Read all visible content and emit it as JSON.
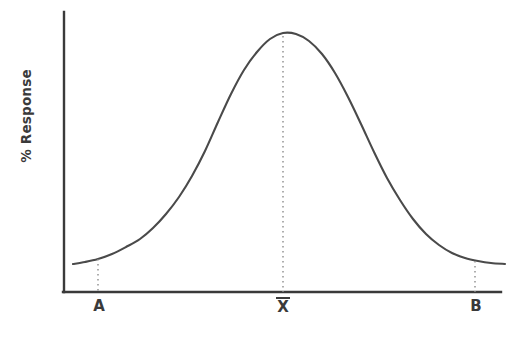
{
  "figure": {
    "kind": "normal-distribution-curve",
    "background": "#ffffff",
    "curve_color": "#4a4a4a",
    "axis_color": "#3a3a3a",
    "guide_color": "#8c8c8c",
    "text_color": "#3a3a3a"
  },
  "chart_data": {
    "type": "line",
    "title": "",
    "subtitle": "",
    "xlabel": "",
    "ylabel": "% Response",
    "grid": false,
    "legend": null,
    "annotations": [
      {
        "name": "lower-limit",
        "label": "A",
        "x": 98,
        "note": "dotted vertical guide from curve to x-axis"
      },
      {
        "name": "mean",
        "label": "X̄",
        "x": 283,
        "note": "dotted vertical guide from curve peak to x-axis"
      },
      {
        "name": "upper-limit",
        "label": "B",
        "x": 475,
        "note": "dotted vertical guide from curve to x-axis"
      }
    ],
    "axis_ranges": {
      "x": [
        0,
        100
      ],
      "y": [
        0,
        100
      ]
    },
    "tick_labels": {
      "x": [
        "A",
        "X̄",
        "B"
      ],
      "y": []
    },
    "series": [
      {
        "name": "% Response",
        "points": [
          [
            73,
            264
          ],
          [
            85,
            262
          ],
          [
            98,
            259
          ],
          [
            112,
            254
          ],
          [
            126,
            247
          ],
          [
            140,
            239
          ],
          [
            153,
            228
          ],
          [
            166,
            214
          ],
          [
            179,
            197
          ],
          [
            192,
            176
          ],
          [
            205,
            151
          ],
          [
            218,
            122
          ],
          [
            231,
            94
          ],
          [
            244,
            70
          ],
          [
            257,
            52
          ],
          [
            270,
            39
          ],
          [
            283,
            33
          ],
          [
            296,
            34
          ],
          [
            309,
            41
          ],
          [
            322,
            54
          ],
          [
            335,
            73
          ],
          [
            348,
            97
          ],
          [
            361,
            124
          ],
          [
            374,
            152
          ],
          [
            387,
            178
          ],
          [
            400,
            200
          ],
          [
            413,
            219
          ],
          [
            426,
            234
          ],
          [
            439,
            245
          ],
          [
            452,
            253
          ],
          [
            465,
            258
          ],
          [
            478,
            261
          ],
          [
            491,
            263
          ],
          [
            505,
            264
          ]
        ]
      }
    ]
  },
  "axes": {
    "y_axis": {
      "x": 64,
      "y_top": 12,
      "y_bottom": 292
    },
    "x_axis": {
      "y": 292,
      "x_left": 64,
      "x_right": 501
    }
  },
  "labels": {
    "y_axis_label": "% Response",
    "tick_a": "A",
    "tick_mean": "X",
    "tick_mean_overbar": true,
    "tick_b": "B"
  }
}
